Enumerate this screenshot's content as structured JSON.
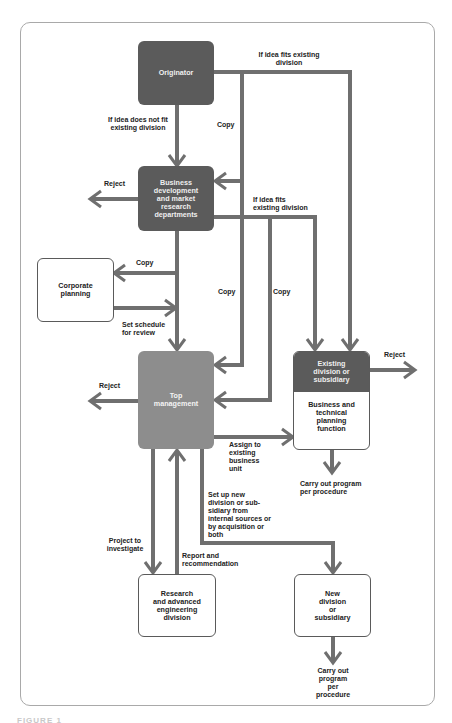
{
  "colors": {
    "dark_box": "#5b5b5b",
    "mid_box": "#8d8d8d",
    "connector": "#6f6f6f",
    "frame": "#a9a9a9"
  },
  "nodes": {
    "originator": "Originator",
    "business_development": "Business\ndevelopment\nand market\nresearch\ndepartments",
    "corporate_planning": "Corporate\nplanning",
    "top_management": "Top\nmanagement",
    "existing_division": {
      "header": "Existing\ndivision or\nsubsidiary",
      "body": "Business and\ntechnical\nplanning\nfunction"
    },
    "research": "Research\nand advanced\nengineering\ndivision",
    "new_division": "New\ndivision\nor\nsubsidiary"
  },
  "edges": {
    "fits_existing_top": "If idea fits existing\ndivision",
    "not_fit": "If idea does not fit\nexisting division",
    "copy_1": "Copy",
    "reject_busdev": "Reject",
    "fits_existing_mid": "If idea fits\nexisting division",
    "copy_corporate": "Copy",
    "set_schedule": "Set schedule\nfor review",
    "copy_2": "Copy",
    "copy_3": "Copy",
    "reject_top": "Reject",
    "reject_existing": "Reject",
    "assign": "Assign to\nexisting\nbusiness\nunit",
    "carry_out_existing": "Carry out program\nper procedure",
    "set_up_new": "Set up new\ndivision or sub-\nsidiary from\ninternal sources or\nby acquisition or\nboth",
    "project": "Project to\ninvestigate",
    "report": "Report and\nrecommendation",
    "carry_out_new": "Carry out\nprogram\nper\nprocedure"
  },
  "caption": "FIGURE 1"
}
